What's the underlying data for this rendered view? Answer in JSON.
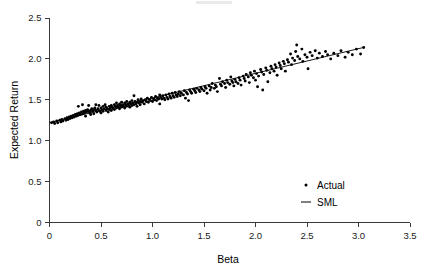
{
  "chart_data": {
    "type": "scatter",
    "title": "",
    "xlabel": "Beta",
    "ylabel": "Expected Return",
    "xlim": [
      0,
      3.5
    ],
    "ylim": [
      0,
      2.5
    ],
    "xticks": [
      0,
      0.5,
      1.0,
      1.5,
      2.0,
      2.5,
      3.0,
      3.5
    ],
    "xtick_labels": [
      "0",
      "0.5",
      "1.0",
      "1.5",
      "2.0",
      "2.5",
      "3.0",
      "3.5"
    ],
    "yticks": [
      0,
      0.5,
      1.0,
      1.5,
      2.0,
      2.5
    ],
    "ytick_labels": [
      "0",
      "0.5",
      "1.0",
      "1.5",
      "2.0",
      "2.5"
    ],
    "grid": false,
    "legend_position": "lower-right-inside",
    "series": [
      {
        "name": "Actual",
        "type": "scatter",
        "marker": "dot",
        "color": "#000000",
        "points": [
          [
            0.02,
            1.22
          ],
          [
            0.04,
            1.23
          ],
          [
            0.05,
            1.21
          ],
          [
            0.07,
            1.24
          ],
          [
            0.08,
            1.22
          ],
          [
            0.1,
            1.25
          ],
          [
            0.11,
            1.23
          ],
          [
            0.12,
            1.26
          ],
          [
            0.13,
            1.24
          ],
          [
            0.15,
            1.27
          ],
          [
            0.16,
            1.25
          ],
          [
            0.17,
            1.28
          ],
          [
            0.18,
            1.26
          ],
          [
            0.19,
            1.29
          ],
          [
            0.2,
            1.27
          ],
          [
            0.21,
            1.3
          ],
          [
            0.22,
            1.28
          ],
          [
            0.23,
            1.31
          ],
          [
            0.24,
            1.29
          ],
          [
            0.25,
            1.32
          ],
          [
            0.26,
            1.3
          ],
          [
            0.27,
            1.33
          ],
          [
            0.28,
            1.31
          ],
          [
            0.28,
            1.42
          ],
          [
            0.29,
            1.34
          ],
          [
            0.3,
            1.32
          ],
          [
            0.31,
            1.35
          ],
          [
            0.32,
            1.33
          ],
          [
            0.32,
            1.44
          ],
          [
            0.33,
            1.36
          ],
          [
            0.34,
            1.34
          ],
          [
            0.35,
            1.37
          ],
          [
            0.35,
            1.3
          ],
          [
            0.36,
            1.35
          ],
          [
            0.37,
            1.38
          ],
          [
            0.38,
            1.36
          ],
          [
            0.38,
            1.43
          ],
          [
            0.39,
            1.34
          ],
          [
            0.4,
            1.37
          ],
          [
            0.4,
            1.32
          ],
          [
            0.41,
            1.39
          ],
          [
            0.42,
            1.36
          ],
          [
            0.43,
            1.38
          ],
          [
            0.43,
            1.33
          ],
          [
            0.44,
            1.4
          ],
          [
            0.45,
            1.37
          ],
          [
            0.45,
            1.44
          ],
          [
            0.46,
            1.35
          ],
          [
            0.47,
            1.39
          ],
          [
            0.48,
            1.37
          ],
          [
            0.48,
            1.43
          ],
          [
            0.49,
            1.36
          ],
          [
            0.5,
            1.4
          ],
          [
            0.5,
            1.34
          ],
          [
            0.51,
            1.38
          ],
          [
            0.52,
            1.42
          ],
          [
            0.52,
            1.36
          ],
          [
            0.53,
            1.39
          ],
          [
            0.54,
            1.44
          ],
          [
            0.55,
            1.37
          ],
          [
            0.55,
            1.41
          ],
          [
            0.56,
            1.39
          ],
          [
            0.57,
            1.35
          ],
          [
            0.58,
            1.42
          ],
          [
            0.58,
            1.38
          ],
          [
            0.59,
            1.4
          ],
          [
            0.6,
            1.43
          ],
          [
            0.6,
            1.37
          ],
          [
            0.61,
            1.41
          ],
          [
            0.62,
            1.39
          ],
          [
            0.63,
            1.44
          ],
          [
            0.63,
            1.38
          ],
          [
            0.64,
            1.42
          ],
          [
            0.65,
            1.4
          ],
          [
            0.65,
            1.46
          ],
          [
            0.66,
            1.43
          ],
          [
            0.67,
            1.41
          ],
          [
            0.68,
            1.45
          ],
          [
            0.68,
            1.39
          ],
          [
            0.69,
            1.43
          ],
          [
            0.7,
            1.41
          ],
          [
            0.7,
            1.47
          ],
          [
            0.71,
            1.44
          ],
          [
            0.72,
            1.42
          ],
          [
            0.73,
            1.46
          ],
          [
            0.73,
            1.4
          ],
          [
            0.74,
            1.44
          ],
          [
            0.75,
            1.48
          ],
          [
            0.75,
            1.42
          ],
          [
            0.76,
            1.45
          ],
          [
            0.77,
            1.43
          ],
          [
            0.78,
            1.47
          ],
          [
            0.78,
            1.41
          ],
          [
            0.79,
            1.45
          ],
          [
            0.8,
            1.49
          ],
          [
            0.8,
            1.43
          ],
          [
            0.81,
            1.46
          ],
          [
            0.82,
            1.44
          ],
          [
            0.82,
            1.55
          ],
          [
            0.83,
            1.48
          ],
          [
            0.84,
            1.45
          ],
          [
            0.85,
            1.47
          ],
          [
            0.85,
            1.42
          ],
          [
            0.86,
            1.5
          ],
          [
            0.87,
            1.46
          ],
          [
            0.88,
            1.48
          ],
          [
            0.88,
            1.44
          ],
          [
            0.89,
            1.51
          ],
          [
            0.9,
            1.47
          ],
          [
            0.91,
            1.49
          ],
          [
            0.92,
            1.45
          ],
          [
            0.93,
            1.5
          ],
          [
            0.94,
            1.48
          ],
          [
            0.95,
            1.52
          ],
          [
            0.96,
            1.47
          ],
          [
            0.97,
            1.5
          ],
          [
            0.98,
            1.49
          ],
          [
            0.99,
            1.53
          ],
          [
            1.0,
            1.48
          ],
          [
            1.01,
            1.51
          ],
          [
            1.02,
            1.5
          ],
          [
            1.03,
            1.54
          ],
          [
            1.04,
            1.49
          ],
          [
            1.05,
            1.52
          ],
          [
            1.06,
            1.51
          ],
          [
            1.07,
            1.56
          ],
          [
            1.07,
            1.45
          ],
          [
            1.08,
            1.53
          ],
          [
            1.09,
            1.51
          ],
          [
            1.1,
            1.55
          ],
          [
            1.11,
            1.52
          ],
          [
            1.12,
            1.5
          ],
          [
            1.13,
            1.56
          ],
          [
            1.14,
            1.53
          ],
          [
            1.15,
            1.51
          ],
          [
            1.16,
            1.57
          ],
          [
            1.17,
            1.54
          ],
          [
            1.18,
            1.52
          ],
          [
            1.19,
            1.58
          ],
          [
            1.2,
            1.55
          ],
          [
            1.21,
            1.53
          ],
          [
            1.22,
            1.59
          ],
          [
            1.23,
            1.56
          ],
          [
            1.24,
            1.54
          ],
          [
            1.25,
            1.57
          ],
          [
            1.26,
            1.6
          ],
          [
            1.27,
            1.55
          ],
          [
            1.28,
            1.58
          ],
          [
            1.3,
            1.56
          ],
          [
            1.31,
            1.61
          ],
          [
            1.32,
            1.52
          ],
          [
            1.33,
            1.59
          ],
          [
            1.34,
            1.57
          ],
          [
            1.35,
            1.49
          ],
          [
            1.36,
            1.62
          ],
          [
            1.37,
            1.6
          ],
          [
            1.38,
            1.58
          ],
          [
            1.4,
            1.63
          ],
          [
            1.41,
            1.61
          ],
          [
            1.42,
            1.59
          ],
          [
            1.43,
            1.64
          ],
          [
            1.45,
            1.62
          ],
          [
            1.46,
            1.6
          ],
          [
            1.47,
            1.65
          ],
          [
            1.48,
            1.63
          ],
          [
            1.5,
            1.61
          ],
          [
            1.51,
            1.66
          ],
          [
            1.52,
            1.64
          ],
          [
            1.53,
            1.58
          ],
          [
            1.55,
            1.67
          ],
          [
            1.56,
            1.62
          ],
          [
            1.57,
            1.65
          ],
          [
            1.58,
            1.7
          ],
          [
            1.6,
            1.64
          ],
          [
            1.61,
            1.68
          ],
          [
            1.62,
            1.66
          ],
          [
            1.63,
            1.6
          ],
          [
            1.65,
            1.76
          ],
          [
            1.66,
            1.69
          ],
          [
            1.67,
            1.67
          ],
          [
            1.68,
            1.72
          ],
          [
            1.7,
            1.7
          ],
          [
            1.71,
            1.65
          ],
          [
            1.72,
            1.74
          ],
          [
            1.73,
            1.71
          ],
          [
            1.75,
            1.69
          ],
          [
            1.76,
            1.78
          ],
          [
            1.77,
            1.73
          ],
          [
            1.78,
            1.71
          ],
          [
            1.79,
            1.67
          ],
          [
            1.8,
            1.75
          ],
          [
            1.81,
            1.72
          ],
          [
            1.83,
            1.7
          ],
          [
            1.84,
            1.77
          ],
          [
            1.85,
            1.74
          ],
          [
            1.86,
            1.68
          ],
          [
            1.88,
            1.79
          ],
          [
            1.89,
            1.76
          ],
          [
            1.9,
            1.73
          ],
          [
            1.91,
            1.81
          ],
          [
            1.93,
            1.78
          ],
          [
            1.94,
            1.71
          ],
          [
            1.95,
            1.83
          ],
          [
            1.96,
            1.8
          ],
          [
            1.98,
            1.77
          ],
          [
            1.99,
            1.85
          ],
          [
            2.0,
            1.74
          ],
          [
            2.01,
            1.82
          ],
          [
            2.02,
            1.66
          ],
          [
            2.03,
            1.79
          ],
          [
            2.05,
            1.87
          ],
          [
            2.06,
            1.84
          ],
          [
            2.07,
            1.62
          ],
          [
            2.08,
            1.81
          ],
          [
            2.1,
            1.89
          ],
          [
            2.11,
            1.86
          ],
          [
            2.12,
            1.72
          ],
          [
            2.14,
            1.83
          ],
          [
            2.15,
            1.91
          ],
          [
            2.16,
            1.88
          ],
          [
            2.18,
            1.85
          ],
          [
            2.19,
            1.93
          ],
          [
            2.2,
            1.9
          ],
          [
            2.21,
            1.8
          ],
          [
            2.23,
            1.95
          ],
          [
            2.24,
            1.92
          ],
          [
            2.25,
            1.88
          ],
          [
            2.27,
            1.97
          ],
          [
            2.28,
            1.94
          ],
          [
            2.29,
            1.85
          ],
          [
            2.31,
            1.99
          ],
          [
            2.32,
            1.96
          ],
          [
            2.34,
            2.06
          ],
          [
            2.35,
            1.93
          ],
          [
            2.36,
            2.01
          ],
          [
            2.38,
            1.98
          ],
          [
            2.39,
            2.09
          ],
          [
            2.4,
            2.17
          ],
          [
            2.41,
            2.03
          ],
          [
            2.43,
            2.0
          ],
          [
            2.45,
            2.12
          ],
          [
            2.46,
            1.97
          ],
          [
            2.48,
            2.05
          ],
          [
            2.5,
            2.02
          ],
          [
            2.51,
            1.88
          ],
          [
            2.53,
            2.08
          ],
          [
            2.55,
            2.04
          ],
          [
            2.58,
            2.1
          ],
          [
            2.6,
            2.01
          ],
          [
            2.62,
            2.07
          ],
          [
            2.65,
            2.03
          ],
          [
            2.68,
            2.09
          ],
          [
            2.7,
            2.05
          ],
          [
            2.73,
            2.0
          ],
          [
            2.76,
            2.07
          ],
          [
            2.8,
            2.04
          ],
          [
            2.83,
            2.1
          ],
          [
            2.87,
            2.02
          ],
          [
            2.9,
            2.08
          ],
          [
            2.94,
            2.05
          ],
          [
            2.98,
            2.12
          ],
          [
            3.02,
            2.06
          ],
          [
            3.05,
            2.14
          ]
        ]
      },
      {
        "name": "SML",
        "type": "line",
        "color": "#000000",
        "intercept": 1.22,
        "slope": 0.301,
        "x_start": 0.0,
        "x_end": 3.05,
        "y_start": 1.22,
        "y_end": 2.14
      }
    ],
    "legend": [
      {
        "label": "Actual",
        "marker": "dot"
      },
      {
        "label": "SML",
        "marker": "line"
      }
    ]
  }
}
